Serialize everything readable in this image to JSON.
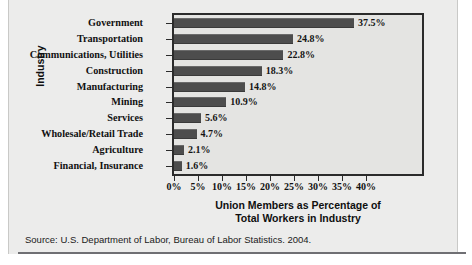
{
  "chart_data": {
    "type": "bar",
    "orientation": "horizontal",
    "title": "",
    "xlabel": "Union Members as Percentage of Total Workers in Industry",
    "ylabel": "Industry",
    "xlim": [
      0,
      40
    ],
    "grid": false,
    "legend": null,
    "categories": [
      "Government",
      "Transportation",
      "Communications, Utilities",
      "Construction",
      "Manufacturing",
      "Mining",
      "Services",
      "Wholesale/Retail Trade",
      "Agriculture",
      "Financial, Insurance"
    ],
    "values": [
      37.5,
      24.8,
      22.8,
      18.3,
      14.8,
      10.9,
      5.6,
      4.7,
      2.1,
      1.6
    ],
    "value_labels": [
      "37.5%",
      "24.8%",
      "22.8%",
      "18.3%",
      "14.8%",
      "10.9%",
      "5.6%",
      "4.7%",
      "2.1%",
      "1.6%"
    ],
    "xticks": [
      0,
      5,
      10,
      15,
      20,
      25,
      30,
      35,
      40
    ],
    "xtick_labels": [
      "0%",
      "5%",
      "10%",
      "15%",
      "20%",
      "25%",
      "30%",
      "35%",
      "40%"
    ],
    "bar_color": "#4d4d4d",
    "plot_background": "#e4e4e2",
    "frame_color": "#2b2b2b"
  },
  "axis_titles": {
    "x_line1": "Union Members as Percentage of",
    "x_line2": "Total Workers in Industry",
    "y": "Industry"
  },
  "source": {
    "text": "Source: U.S. Department of Labor, Bureau of Labor Statistics. 2004."
  }
}
